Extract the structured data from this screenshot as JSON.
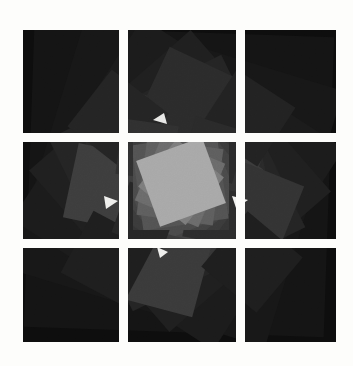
{
  "artwork": {
    "title": "Recursive Rotated Squares",
    "description": "Abstract monochrome composition: a spiral of overlapping rotated squares radiating from a bright centre over a large dark square that is split into a 3x3 grid by white gaps.",
    "canvas": {
      "width": 353,
      "height": 366
    },
    "background_color": "#fdfdfb",
    "gap_color": "#fdfdfb",
    "palette": {
      "background": "#fdfdfb",
      "outer_panel": "#0d0d0d",
      "inner_panel": "#080808",
      "dark_1": "#161616",
      "dark_2": "#1d1d1d",
      "dark_3": "#242424",
      "mid_1": "#2e2e2e",
      "mid_2": "#3a3a3a",
      "mid_3": "#474747",
      "light_1": "#5a5a5a",
      "light_2": "#6e6e6e",
      "highlight": "#a8a8a8"
    },
    "outer_panel": {
      "x": 23,
      "y": 30,
      "width": 313,
      "height": 312,
      "fill": "#0d0d0d",
      "grid": {
        "rows": 3,
        "cols": 3,
        "gap": 9
      },
      "col_splits": [
        119,
        236
      ],
      "row_splits": [
        133,
        239
      ]
    },
    "inner_panel": {
      "x": 133,
      "y": 136,
      "width": 96,
      "height": 94,
      "fill": "#080808"
    },
    "squares": [
      {
        "id": "s1",
        "cx": 179,
        "cy": 182,
        "size": 300,
        "rotation": 2,
        "fill": "#141414",
        "opacity": 1.0
      },
      {
        "id": "s2",
        "cx": 176,
        "cy": 180,
        "size": 268,
        "rotation": 17,
        "fill": "#171717",
        "opacity": 1.0
      },
      {
        "id": "s3",
        "cx": 178,
        "cy": 184,
        "size": 240,
        "rotation": 33,
        "fill": "#1b1b1b",
        "opacity": 1.0
      },
      {
        "id": "s4",
        "cx": 180,
        "cy": 181,
        "size": 214,
        "rotation": 49,
        "fill": "#1f1f1f",
        "opacity": 1.0
      },
      {
        "id": "s5",
        "cx": 177,
        "cy": 183,
        "size": 192,
        "rotation": 64,
        "fill": "#242424",
        "opacity": 1.0
      },
      {
        "id": "s6",
        "cx": 180,
        "cy": 180,
        "size": 171,
        "rotation": 79,
        "fill": "#292929",
        "opacity": 1.0
      },
      {
        "id": "s7",
        "cx": 178,
        "cy": 182,
        "size": 153,
        "rotation": 95,
        "fill": "#2f2f2f",
        "opacity": 1.0
      },
      {
        "id": "s8",
        "cx": 181,
        "cy": 181,
        "size": 137,
        "rotation": 110,
        "fill": "#353535",
        "opacity": 1.0
      },
      {
        "id": "s9",
        "cx": 178,
        "cy": 183,
        "size": 122,
        "rotation": 126,
        "fill": "#3b3b3b",
        "opacity": 1.0
      },
      {
        "id": "s10",
        "cx": 180,
        "cy": 181,
        "size": 109,
        "rotation": 141,
        "fill": "#424242",
        "opacity": 1.0
      },
      {
        "id": "s11",
        "cx": 179,
        "cy": 182,
        "size": 97,
        "rotation": 157,
        "fill": "#4a4a4a",
        "opacity": 1.0
      },
      {
        "id": "s12",
        "cx": 180,
        "cy": 182,
        "size": 86,
        "rotation": 172,
        "fill": "#535353",
        "opacity": 1.0
      },
      {
        "id": "s13",
        "cx": 180,
        "cy": 182,
        "size": 77,
        "rotation": 188,
        "fill": "#5e5e5e",
        "opacity": 1.0
      },
      {
        "id": "s14",
        "cx": 180,
        "cy": 182,
        "size": 69,
        "rotation": 203,
        "fill": "#6b6b6b",
        "opacity": 1.0
      },
      {
        "id": "s15",
        "cx": 181,
        "cy": 182,
        "size": 61,
        "rotation": 219,
        "fill": "#7c7c7c",
        "opacity": 1.0
      },
      {
        "id": "s16",
        "cx": 181,
        "cy": 182,
        "size": 55,
        "rotation": 234,
        "fill": "#8d8d8d",
        "opacity": 1.0
      },
      {
        "id": "s17",
        "cx": 181,
        "cy": 182,
        "size": 70,
        "rotation": 250,
        "fill": "#a8a8a8",
        "opacity": 1.0
      }
    ],
    "satellites": [
      {
        "id": "t1",
        "cx": 108,
        "cy": 188,
        "size": 76,
        "rotation": 12,
        "fill": "#3d3d3d"
      },
      {
        "id": "t2",
        "cx": 256,
        "cy": 207,
        "size": 74,
        "rotation": 22,
        "fill": "#333333"
      },
      {
        "id": "t3",
        "cx": 166,
        "cy": 272,
        "size": 74,
        "rotation": 15,
        "fill": "#3a3a3a"
      },
      {
        "id": "t4",
        "cx": 189,
        "cy": 100,
        "size": 80,
        "rotation": 25,
        "fill": "#2b2b2b"
      },
      {
        "id": "t5",
        "cx": 118,
        "cy": 120,
        "size": 72,
        "rotation": 38,
        "fill": "#242424"
      },
      {
        "id": "t6",
        "cx": 247,
        "cy": 118,
        "size": 70,
        "rotation": 33,
        "fill": "#222222"
      },
      {
        "id": "t7",
        "cx": 252,
        "cy": 262,
        "size": 72,
        "rotation": 40,
        "fill": "#1e1e1e"
      },
      {
        "id": "t8",
        "cx": 108,
        "cy": 258,
        "size": 70,
        "rotation": 28,
        "fill": "#1e1e1e"
      },
      {
        "id": "t9",
        "cx": 147,
        "cy": 150,
        "size": 56,
        "rotation": 8,
        "fill": "#303030"
      },
      {
        "id": "t10",
        "cx": 214,
        "cy": 150,
        "size": 54,
        "rotation": 17,
        "fill": "#2a2a2a"
      },
      {
        "id": "t11",
        "cx": 214,
        "cy": 215,
        "size": 54,
        "rotation": 11,
        "fill": "#2c2c2c"
      },
      {
        "id": "t12",
        "cx": 146,
        "cy": 216,
        "size": 54,
        "rotation": 20,
        "fill": "#262626"
      }
    ],
    "highlights": [
      {
        "id": "h1",
        "points": "232,196 248,200 236,208",
        "fill": "#f2f2f0"
      },
      {
        "id": "h2",
        "points": "104,196 118,201 106,209",
        "fill": "#efefed"
      },
      {
        "id": "h3",
        "points": "157,247 168,252 160,258",
        "fill": "#eeeeec"
      },
      {
        "id": "h4",
        "points": "153,120 164,113 167,124",
        "fill": "#e8e8e6"
      }
    ]
  }
}
